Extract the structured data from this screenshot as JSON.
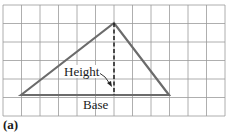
{
  "figure": {
    "panel_label": "(a)",
    "height_label": "Height",
    "base_label": "Base",
    "grid": {
      "x0": 3,
      "y0": 5,
      "cell": 18.5,
      "cols": 12,
      "rows": 6,
      "color": "#9a9a9a"
    },
    "triangle": {
      "points": [
        [
          21,
          95
        ],
        [
          114,
          23
        ],
        [
          169,
          95
        ]
      ],
      "stroke": "#6b6b6b"
    },
    "height_line": {
      "x": 114,
      "y1": 23,
      "y2": 95
    },
    "colors": {
      "grid": "#9a9a9a",
      "triangle": "#6b6b6b",
      "text": "#1a1a1a"
    }
  }
}
